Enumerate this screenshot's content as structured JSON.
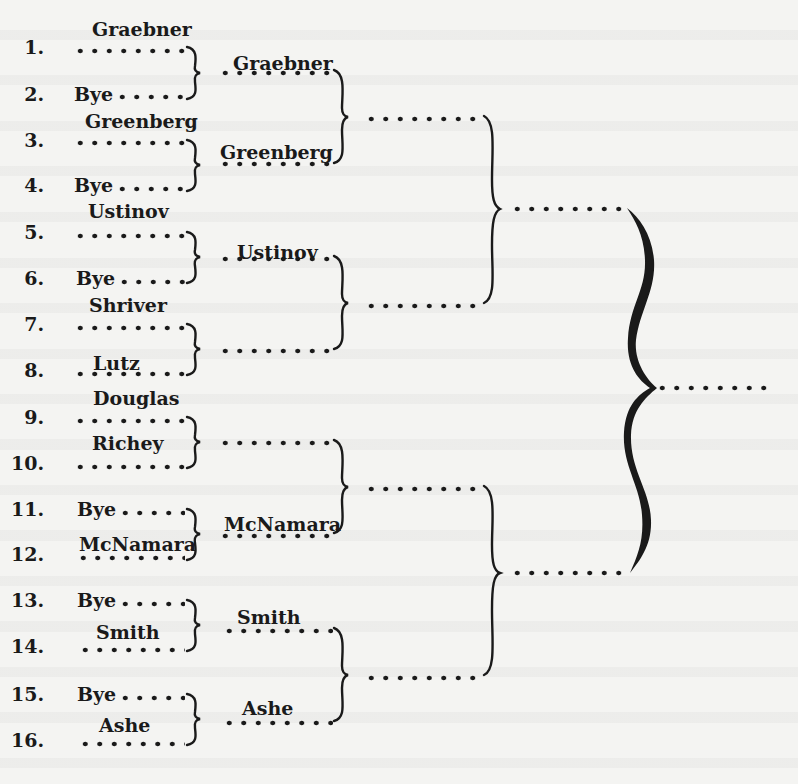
{
  "bracket": {
    "round1": [
      {
        "seed": "1.",
        "player": "Graebner",
        "label_raised": true
      },
      {
        "seed": "2.",
        "player": "Bye",
        "label_raised": false
      },
      {
        "seed": "3.",
        "player": "Greenberg",
        "label_raised": true
      },
      {
        "seed": "4.",
        "player": "Bye",
        "label_raised": false
      },
      {
        "seed": "5.",
        "player": "Ustinov",
        "label_raised": true
      },
      {
        "seed": "6.",
        "player": "Bye",
        "label_raised": false
      },
      {
        "seed": "7.",
        "player": "Shriver",
        "label_raised": true
      },
      {
        "seed": "8.",
        "player": "Lutz",
        "label_raised": true
      },
      {
        "seed": "9.",
        "player": "Douglas",
        "label_raised": true
      },
      {
        "seed": "10.",
        "player": "Richey",
        "label_raised": true
      },
      {
        "seed": "11.",
        "player": "Bye",
        "label_raised": false
      },
      {
        "seed": "12.",
        "player": "McNamara",
        "label_raised": true
      },
      {
        "seed": "13.",
        "player": "Bye",
        "label_raised": false
      },
      {
        "seed": "14.",
        "player": "Smith",
        "label_raised": true
      },
      {
        "seed": "15.",
        "player": "Bye",
        "label_raised": false
      },
      {
        "seed": "16.",
        "player": "Ashe",
        "label_raised": true
      }
    ],
    "round2": [
      "Graebner",
      "Greenberg",
      "Ustinov",
      "",
      "",
      "McNamara",
      "Smith",
      "Ashe"
    ],
    "round3": [
      "",
      "",
      "",
      ""
    ],
    "round4": [
      "",
      ""
    ],
    "final": ""
  }
}
